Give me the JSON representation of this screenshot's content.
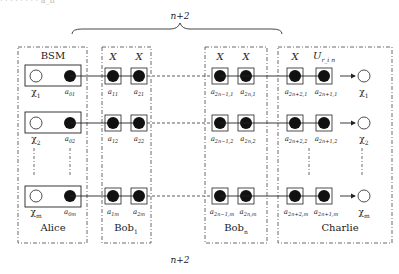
{
  "diagram": {
    "top_cut_text": "· · · · · · · · a_n",
    "brace_top_label": "n+2",
    "bottom_label": "n+2",
    "parties": [
      {
        "name": "Alice",
        "header": "BSM"
      },
      {
        "name": "Bob",
        "subscript": "1",
        "header_ops": [
          "X",
          "X"
        ]
      },
      {
        "name": "Bob",
        "subscript": "n",
        "header_ops": [
          "X",
          "X"
        ]
      },
      {
        "name": "Charlie",
        "header_ops": [
          "X",
          "U_{r_i,n}"
        ]
      }
    ],
    "header_labels": {
      "bsm": "BSM",
      "bob1_op1": "X",
      "bob1_op2": "X",
      "bobn_op1": "X",
      "bobn_op2": "X",
      "charlie_op1": "X",
      "charlie_op2_main": "U",
      "charlie_op2_sub": "r_i n"
    },
    "party_names": {
      "alice": "Alice",
      "bob1_main": "Bob",
      "bob1_sub": "1",
      "bobn_main": "Bob",
      "bobn_sub": "n",
      "charlie": "Charlie"
    },
    "rows": [
      {
        "id": "row-1",
        "chi": {
          "main": "χ",
          "sub": "1"
        },
        "alice_qubit": {
          "main": "a",
          "sub": "01"
        },
        "bob1": [
          {
            "main": "a",
            "sub": "11"
          },
          {
            "main": "a",
            "sub": "21"
          }
        ],
        "bobn": [
          {
            "main": "a",
            "sub": "2n−1,1"
          },
          {
            "main": "a",
            "sub": "2n,1"
          }
        ],
        "charlie": [
          {
            "main": "a",
            "sub": "2n+2,1"
          },
          {
            "main": "a",
            "sub": "2n+1,1"
          }
        ],
        "output": {
          "main": "χ",
          "sub": "1"
        }
      },
      {
        "id": "row-2",
        "chi": {
          "main": "χ",
          "sub": "2"
        },
        "alice_qubit": {
          "main": "a",
          "sub": "02"
        },
        "bob1": [
          {
            "main": "a",
            "sub": "12"
          },
          {
            "main": "a",
            "sub": "22"
          }
        ],
        "bobn": [
          {
            "main": "a",
            "sub": "2n−1,2"
          },
          {
            "main": "a",
            "sub": "2n,2"
          }
        ],
        "charlie": [
          {
            "main": "a",
            "sub": "2n+2,2"
          },
          {
            "main": "a",
            "sub": "2n+1,2"
          }
        ],
        "output": {
          "main": "χ",
          "sub": "2"
        }
      },
      {
        "id": "row-m",
        "chi": {
          "main": "χ",
          "sub": "m"
        },
        "alice_qubit": {
          "main": "a",
          "sub": "0m"
        },
        "bob1": [
          {
            "main": "a",
            "sub": "1m"
          },
          {
            "main": "a",
            "sub": "2m"
          }
        ],
        "bobn": [
          {
            "main": "a",
            "sub": "2n−1,m"
          },
          {
            "main": "a",
            "sub": "2n,m"
          }
        ],
        "charlie": [
          {
            "main": "a",
            "sub": "2n+2,m"
          },
          {
            "main": "a",
            "sub": "2n+1,m"
          }
        ],
        "output": {
          "main": "χ",
          "sub": "m"
        }
      }
    ],
    "colors": {
      "line": "#222222",
      "dash_box": "#444444",
      "filled_qubit": "#111111",
      "empty_qubit": "#ffffff"
    }
  }
}
